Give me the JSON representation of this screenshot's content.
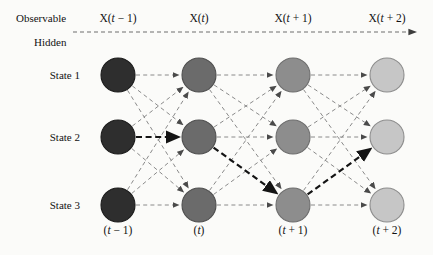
{
  "figure": {
    "background": "#fbfbf9",
    "type": "hmm-trellis-diagram"
  },
  "axis_labels": {
    "observable": "Observable",
    "hidden": "Hidden"
  },
  "row_labels": [
    {
      "id": "state-1",
      "label": "State 1"
    },
    {
      "id": "state-2",
      "label": "State 2"
    },
    {
      "id": "state-3",
      "label": "State 3"
    }
  ],
  "column_headers": [
    {
      "id": "col-t-minus-1",
      "label": "X(t − 1)"
    },
    {
      "id": "col-t",
      "label": "X(t)"
    },
    {
      "id": "col-t-plus-1",
      "label": "X(t + 1)"
    },
    {
      "id": "col-t-plus-2",
      "label": "X(t + 2)"
    }
  ],
  "column_footers": [
    {
      "id": "foot-t-minus-1",
      "label": "(t − 1)"
    },
    {
      "id": "foot-t",
      "label": "(t)"
    },
    {
      "id": "foot-t-plus-1",
      "label": "(t + 1)"
    },
    {
      "id": "foot-t-plus-2",
      "label": "(t + 2)"
    }
  ],
  "chart_data": {
    "type": "diagram",
    "columns": 4,
    "rows": 3,
    "node_radius": 17,
    "column_x": [
      118,
      199,
      293,
      387
    ],
    "row_y": [
      75,
      137,
      205
    ],
    "node_fill_by_column": [
      "#2e2e2e",
      "#6b6b6b",
      "#8d8d8d",
      "#c6c6c6"
    ],
    "node_stroke_by_column": [
      "#1a1a1a",
      "#4e4e4e",
      "#6d6d6d",
      "#8d8d8d"
    ],
    "edges": {
      "style": "dashed",
      "color": "#8a8a8a",
      "fully_connected_between_adjacent_columns": true,
      "description": "Every node in column k connects to all 3 nodes in column k+1"
    },
    "highlighted_path": {
      "label": "most-likely state sequence",
      "color": "#141414",
      "style": "bold dashed",
      "sequence": [
        {
          "column": 0,
          "state": 2
        },
        {
          "column": 1,
          "state": 2
        },
        {
          "column": 2,
          "state": 3
        },
        {
          "column": 3,
          "state": 2
        }
      ]
    },
    "observable_arrow": {
      "y": 32,
      "x_start": 73,
      "x_end": 421,
      "style": "dashed",
      "color": "#6f6f6f",
      "arrowhead": "right"
    }
  }
}
